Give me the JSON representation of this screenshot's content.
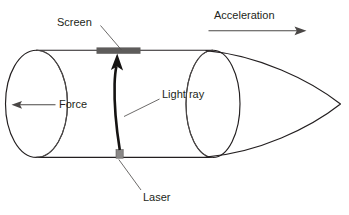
{
  "figure": {
    "background_color": "#ffffff",
    "ink_color": "#231f20",
    "accent_gray": "#5e5c5b",
    "labels": {
      "screen": "Screen",
      "acceleration": "Acceleration",
      "force": "Force",
      "light_ray": "Light ray",
      "laser": "Laser"
    },
    "parts": [
      {
        "name": "screen",
        "label": "Screen",
        "kind": "bar",
        "color": "#5e5c5b"
      },
      {
        "name": "laser",
        "label": "Laser",
        "kind": "box",
        "color": "#8a8887"
      },
      {
        "name": "light-ray",
        "label": "Light ray",
        "kind": "curved-arrow",
        "color": "#151312"
      },
      {
        "name": "force-arrow",
        "label": "Force",
        "kind": "arrow",
        "direction": "left",
        "color": "#4a4746"
      },
      {
        "name": "acceleration-arrow",
        "label": "Acceleration",
        "kind": "arrow",
        "direction": "right",
        "color": "#4a4746"
      },
      {
        "name": "rocket-body",
        "label": "",
        "kind": "cylinder-with-cone",
        "color": "#231f20"
      }
    ]
  }
}
